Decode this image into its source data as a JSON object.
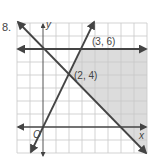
{
  "problem": {
    "number": "8."
  },
  "graph": {
    "axis_labels": {
      "x": "x",
      "y": "y",
      "origin": "O"
    },
    "points": [
      {
        "label": "(3, 6)",
        "x": 3,
        "y": 6
      },
      {
        "label": "(2, 4)",
        "x": 2,
        "y": 4
      }
    ],
    "lines": [
      {
        "name": "y = 6",
        "from": [
          -2,
          6
        ],
        "to": [
          8,
          6
        ]
      },
      {
        "name": "y = 0",
        "from": [
          -2,
          0
        ],
        "to": [
          8,
          0
        ]
      },
      {
        "name": "y = 2x",
        "from": [
          -1,
          -2
        ],
        "to": [
          4,
          8
        ]
      },
      {
        "name": "y = -x + 6",
        "from": [
          -2,
          8
        ],
        "to": [
          8,
          -2
        ]
      }
    ],
    "grid": {
      "xmin": -2,
      "xmax": 8,
      "ymin": -2,
      "ymax": 8
    },
    "colors": {
      "line": "#444444",
      "grid": "#c8c8c8",
      "shade": "#dcdcdc"
    }
  }
}
